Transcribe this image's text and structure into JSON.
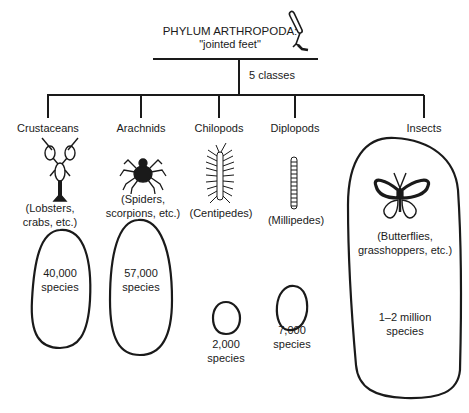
{
  "header": {
    "title": "PHYLUM ARTHROPODA:",
    "subtitle": "\"jointed feet\"",
    "branch_label": "5 classes",
    "icon": "jointed-leg-icon"
  },
  "classes": [
    {
      "name": "Crustaceans",
      "examples_line1": "(Lobsters,",
      "examples_line2": "crabs, etc.)",
      "species_line1": "40,000",
      "species_line2": "species",
      "icon": "lobster-icon"
    },
    {
      "name": "Arachnids",
      "examples_line1": "(Spiders,",
      "examples_line2": "scorpions, etc.)",
      "species_line1": "57,000",
      "species_line2": "species",
      "icon": "spider-icon"
    },
    {
      "name": "Chilopods",
      "examples_line1": "(Centipedes)",
      "species_line1": "2,000",
      "species_line2": "species",
      "icon": "centipede-icon"
    },
    {
      "name": "Diplopods",
      "examples_line1": "(Millipedes)",
      "species_line1": "7,000",
      "species_line2": "species",
      "icon": "millipede-icon"
    },
    {
      "name": "Insects",
      "examples_line1": "(Butterflies,",
      "examples_line2": "grasshoppers, etc.)",
      "species_line1": "1–2 million",
      "species_line2": "species",
      "icon": "butterfly-icon"
    }
  ],
  "colors": {
    "ink": "#1a1a1a",
    "background": "#ffffff"
  }
}
